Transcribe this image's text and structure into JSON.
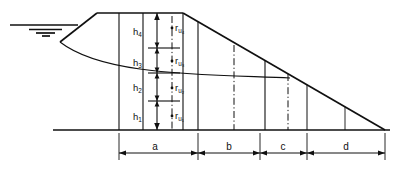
{
  "figure": {
    "type": "engineering-cross-section",
    "stroke_color": "#101010",
    "background_color": "#ffffff"
  },
  "height_labels": [
    {
      "id": "h1",
      "base": "h",
      "sub": "1"
    },
    {
      "id": "h2",
      "base": "h",
      "sub": "2"
    },
    {
      "id": "h3",
      "base": "h",
      "sub": "3"
    },
    {
      "id": "h4",
      "base": "h",
      "sub": "4"
    }
  ],
  "ru_labels": [
    {
      "id": "ru1",
      "base": "r",
      "sub": "u₁"
    },
    {
      "id": "ru2",
      "base": "r",
      "sub": "u₂"
    },
    {
      "id": "ru3",
      "base": "r",
      "sub": "u₃"
    },
    {
      "id": "ru4",
      "base": "r",
      "sub": "u₄"
    }
  ],
  "dimensions": [
    {
      "id": "a",
      "label": "a"
    },
    {
      "id": "b",
      "label": "b"
    },
    {
      "id": "c",
      "label": "c"
    },
    {
      "id": "d",
      "label": "d"
    }
  ],
  "elements": {
    "water_table_symbol": "water-table-triangle",
    "phreatic_surface": "seepage-line",
    "ground_line": "base-ground-line",
    "crest": "embankment-crest",
    "upstream_face": "upstream-slope",
    "downstream_face": "downstream-slope"
  },
  "geometry": {
    "water_line_y": 25,
    "crest_y": 13,
    "base_y": 130,
    "crest_left_x": 97,
    "crest_right_x": 183,
    "toe_x": 385,
    "dim_line_y": 153,
    "dim_stations": [
      119,
      198,
      260,
      307,
      385
    ],
    "h_dim_x": 157,
    "h_dim_ticks": [
      13,
      48,
      73,
      101,
      130
    ],
    "ru_chain_x": 172
  }
}
